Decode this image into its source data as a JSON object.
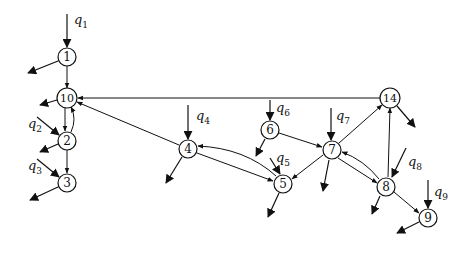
{
  "diagram": {
    "type": "network-flow-graph",
    "colors": {
      "stroke": "#111111",
      "background": "#ffffff",
      "node_fill": "#ffffff"
    },
    "nodes": [
      {
        "id": "1",
        "label": "1",
        "x": 67,
        "y": 57
      },
      {
        "id": "10",
        "label": "10",
        "x": 67,
        "y": 98
      },
      {
        "id": "2",
        "label": "2",
        "x": 67,
        "y": 141
      },
      {
        "id": "3",
        "label": "3",
        "x": 67,
        "y": 183
      },
      {
        "id": "4",
        "label": "4",
        "x": 188,
        "y": 149
      },
      {
        "id": "5",
        "label": "5",
        "x": 283,
        "y": 184
      },
      {
        "id": "6",
        "label": "6",
        "x": 270,
        "y": 130
      },
      {
        "id": "7",
        "label": "7",
        "x": 332,
        "y": 150
      },
      {
        "id": "14",
        "label": "14",
        "x": 390,
        "y": 98
      },
      {
        "id": "8",
        "label": "8",
        "x": 386,
        "y": 187
      },
      {
        "id": "9",
        "label": "9",
        "x": 428,
        "y": 218
      }
    ],
    "inputs": [
      {
        "label": "q",
        "sub": "1",
        "target": "1",
        "lx": 76,
        "ly": 20
      },
      {
        "label": "q",
        "sub": "2",
        "target": "2",
        "lx": 28,
        "ly": 128
      },
      {
        "label": "q",
        "sub": "3",
        "target": "3",
        "lx": 28,
        "ly": 170
      },
      {
        "label": "q",
        "sub": "4",
        "target": "4",
        "lx": 196,
        "ly": 120
      },
      {
        "label": "q",
        "sub": "5",
        "target": "5",
        "lx": 277,
        "ly": 162
      },
      {
        "label": "q",
        "sub": "6",
        "target": "6",
        "lx": 276,
        "ly": 113
      },
      {
        "label": "q",
        "sub": "7",
        "target": "7",
        "lx": 336,
        "ly": 120
      },
      {
        "label": "q",
        "sub": "8",
        "target": "8",
        "lx": 408,
        "ly": 168
      },
      {
        "label": "q",
        "sub": "9",
        "target": "9",
        "lx": 434,
        "ly": 196
      }
    ],
    "edges": [
      {
        "from": "1",
        "to": "10"
      },
      {
        "from": "10",
        "to": "2"
      },
      {
        "from": "2",
        "to": "10",
        "curved": true
      },
      {
        "from": "2",
        "to": "3"
      },
      {
        "from": "14",
        "to": "10"
      },
      {
        "from": "4",
        "to": "10"
      },
      {
        "from": "4",
        "to": "5"
      },
      {
        "from": "5",
        "to": "4",
        "curved": true
      },
      {
        "from": "6",
        "to": "7"
      },
      {
        "from": "7",
        "to": "5"
      },
      {
        "from": "7",
        "to": "14"
      },
      {
        "from": "8",
        "to": "14"
      },
      {
        "from": "7",
        "to": "8"
      },
      {
        "from": "8",
        "to": "7",
        "curved": true
      },
      {
        "from": "8",
        "to": "9"
      }
    ],
    "outflows": [
      "1",
      "10",
      "2",
      "3",
      "4",
      "5",
      "6",
      "7",
      "14",
      "8",
      "9"
    ]
  }
}
